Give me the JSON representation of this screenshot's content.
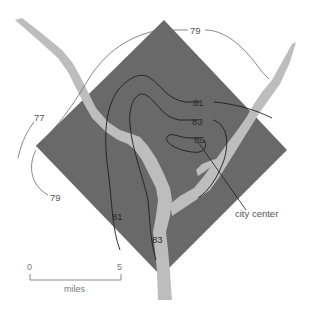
{
  "map": {
    "type": "isotherm map",
    "colors": {
      "city_area": "#696969",
      "river": "#bdbdbd",
      "isotherm_line": "#1e1e1e",
      "background": "#ffffff"
    },
    "isotherm_labels": {
      "l77": "77",
      "l79_top": "79",
      "l79_left": "79",
      "l81_right": "81",
      "l81_bottom": "81",
      "l83_right": "83",
      "l83_bottom": "83",
      "l85": "85"
    },
    "annotation": {
      "city_center": "city center"
    },
    "scale_bar": {
      "start": "0",
      "end": "5",
      "unit": "miles"
    }
  }
}
